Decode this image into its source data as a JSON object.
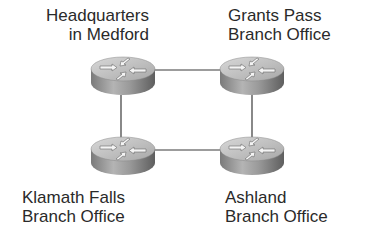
{
  "diagram": {
    "type": "network-topology",
    "topology": "ring",
    "nodes": [
      {
        "id": "hq",
        "kind": "router",
        "label": [
          "Headquarters",
          "in Medford"
        ],
        "x": 123,
        "y": 76
      },
      {
        "id": "gp",
        "kind": "router",
        "label": [
          "Grants Pass",
          "Branch Office"
        ],
        "x": 252,
        "y": 76
      },
      {
        "id": "kf",
        "kind": "router",
        "label": [
          "Klamath Falls",
          "Branch Office"
        ],
        "x": 123,
        "y": 156
      },
      {
        "id": "as",
        "kind": "router",
        "label": [
          "Ashland",
          "Branch Office"
        ],
        "x": 252,
        "y": 156
      }
    ],
    "links": [
      {
        "from": "hq",
        "to": "gp"
      },
      {
        "from": "gp",
        "to": "as"
      },
      {
        "from": "as",
        "to": "kf"
      },
      {
        "from": "kf",
        "to": "hq"
      }
    ],
    "colors": {
      "link": "#3a3a3a",
      "text": "#2a2a2a",
      "router_top": "#c8c8c8",
      "router_side": "#8e8e8e"
    }
  }
}
